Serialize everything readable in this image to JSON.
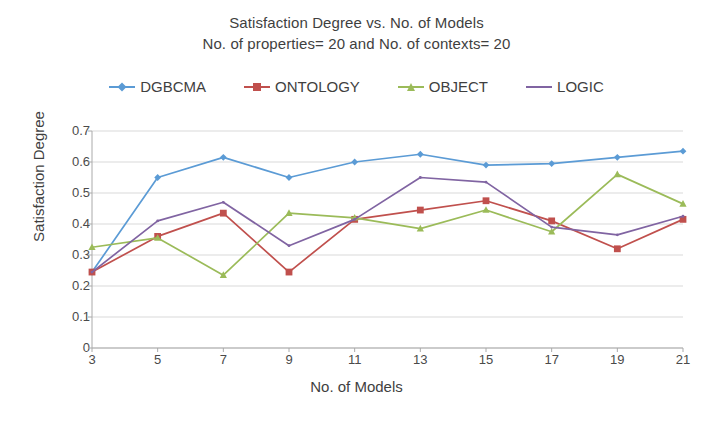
{
  "title": {
    "line1": "Satisfaction Degree vs. No. of Models",
    "line2": "No. of properties= 20 and  No. of contexts=  20"
  },
  "axes": {
    "ylabel": "Satisfaction Degree",
    "xlabel": "No. of Models",
    "yticks": [
      "0.7",
      "0.6",
      "0.5",
      "0.4",
      "0.3",
      "0.2",
      "0.1",
      "0"
    ],
    "xticks": [
      "3",
      "5",
      "7",
      "9",
      "11",
      "13",
      "15",
      "17",
      "19",
      "21"
    ]
  },
  "legend": [
    {
      "label": "DGBCMA",
      "color": "#5B9BD5",
      "marker": "diamond"
    },
    {
      "label": "ONTOLOGY",
      "color": "#C0504D",
      "marker": "square"
    },
    {
      "label": "OBJECT",
      "color": "#9BBB59",
      "marker": "triangle"
    },
    {
      "label": "LOGIC",
      "color": "#8064A2",
      "marker": "none"
    }
  ],
  "chart_data": {
    "type": "line",
    "xlabel": "No. of Models",
    "ylabel": "Satisfaction Degree",
    "x": [
      3,
      5,
      7,
      9,
      11,
      13,
      15,
      17,
      19,
      21
    ],
    "xlim": [
      3,
      21
    ],
    "ylim": [
      0,
      0.7
    ],
    "ytick_step": 0.1,
    "grid": "horizontal",
    "legend_position": "top",
    "series": [
      {
        "name": "DGBCMA",
        "color": "#5B9BD5",
        "marker": "diamond",
        "values": [
          0.245,
          0.55,
          0.615,
          0.55,
          0.6,
          0.625,
          0.59,
          0.595,
          0.615,
          0.635
        ]
      },
      {
        "name": "ONTOLOGY",
        "color": "#C0504D",
        "marker": "square",
        "values": [
          0.245,
          0.36,
          0.435,
          0.245,
          0.415,
          0.445,
          0.475,
          0.41,
          0.32,
          0.415
        ]
      },
      {
        "name": "OBJECT",
        "color": "#9BBB59",
        "marker": "triangle",
        "values": [
          0.325,
          0.355,
          0.235,
          0.435,
          0.42,
          0.385,
          0.445,
          0.375,
          0.56,
          0.465
        ]
      },
      {
        "name": "LOGIC",
        "color": "#8064A2",
        "marker": "none",
        "values": [
          0.245,
          0.41,
          0.47,
          0.33,
          0.415,
          0.55,
          0.535,
          0.39,
          0.365,
          0.425
        ]
      }
    ]
  }
}
